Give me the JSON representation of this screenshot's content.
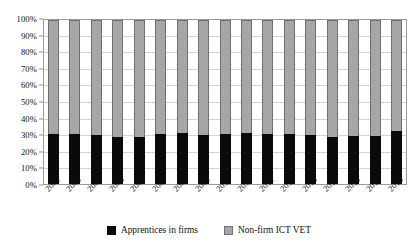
{
  "chart_data": {
    "type": "bar",
    "stacked": true,
    "normalized": "100%",
    "title": "",
    "xlabel": "",
    "ylabel": "",
    "ylim": [
      0,
      100
    ],
    "yticks": [
      "0%",
      "10%",
      "20%",
      "30%",
      "40%",
      "50%",
      "60%",
      "70%",
      "80%",
      "90%",
      "100%"
    ],
    "ytick_values": [
      0,
      10,
      20,
      30,
      40,
      50,
      60,
      70,
      80,
      90,
      100
    ],
    "grid": true,
    "legend_position": "bottom",
    "categories": [
      "2002",
      "2003",
      "2004",
      "2005",
      "2006",
      "2007",
      "2008",
      "2009",
      "2010",
      "2011",
      "2012",
      "2013",
      "2014",
      "2015",
      "2016",
      "2017",
      "2018"
    ],
    "series": [
      {
        "name": "Apprentices in firms",
        "color": "#0a0a0a",
        "values": [
          30.2,
          30.6,
          30.0,
          28.6,
          28.9,
          30.3,
          31.2,
          29.8,
          30.5,
          31.1,
          30.4,
          30.6,
          29.6,
          28.6,
          29.0,
          29.4,
          32.6
        ]
      },
      {
        "name": "Non-firm ICT VET",
        "color": "#a6a6a6",
        "values": [
          69.8,
          69.4,
          70.0,
          71.4,
          71.1,
          69.7,
          68.8,
          70.2,
          69.5,
          68.9,
          69.6,
          69.4,
          70.4,
          71.4,
          71.0,
          70.6,
          67.4
        ]
      }
    ]
  },
  "legend": {
    "items": [
      {
        "label": "Apprentices in firms",
        "swatch": "black"
      },
      {
        "label": "Non-firm ICT VET",
        "swatch": "gray"
      }
    ]
  },
  "colors": {
    "apprentices": "#0a0a0a",
    "non_firm": "#a6a6a6",
    "gridline": "#d4d4d4",
    "frame": "#9a9a9a",
    "background": "#ffffff"
  }
}
